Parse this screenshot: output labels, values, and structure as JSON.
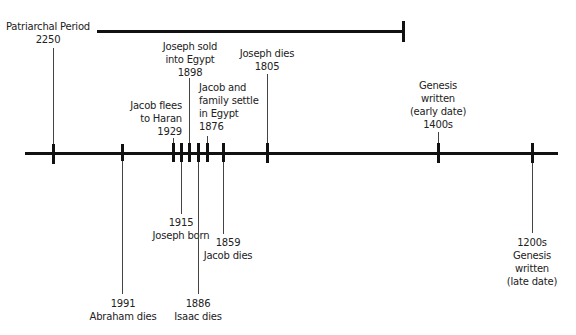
{
  "period": {
    "label": "Patriarchal Period",
    "start": "2250"
  },
  "events": [
    {
      "id": "patriarchal-start",
      "year": "2250",
      "text": "Patriarchal Period"
    },
    {
      "id": "abraham-dies",
      "year": "1991",
      "text": "Abraham dies"
    },
    {
      "id": "jacob-flees",
      "year": "1929",
      "text": "Jacob flees to Haran",
      "lines": [
        "Jacob flees",
        "to Haran"
      ]
    },
    {
      "id": "joseph-born",
      "year": "1915",
      "text": "Joseph born"
    },
    {
      "id": "joseph-sold",
      "year": "1898",
      "text": "Joseph sold into Egypt",
      "lines": [
        "Joseph sold",
        "into Egypt"
      ]
    },
    {
      "id": "isaac-dies",
      "year": "1886",
      "text": "Isaac dies"
    },
    {
      "id": "jacob-settles",
      "year": "1876",
      "text": "Jacob and family settle in Egypt",
      "lines": [
        "Jacob and",
        "family settle",
        "in Egypt"
      ]
    },
    {
      "id": "jacob-dies",
      "year": "1859",
      "text": "Jacob dies"
    },
    {
      "id": "joseph-dies",
      "year": "1805",
      "text": "Joseph dies"
    },
    {
      "id": "genesis-early",
      "year": "1400s",
      "text": "Genesis written (early date)",
      "lines": [
        "Genesis",
        "written",
        "(early date)"
      ]
    },
    {
      "id": "genesis-late",
      "year": "1200s",
      "text": "Genesis written (late date)",
      "lines": [
        "Genesis",
        "written",
        "(late date)"
      ]
    }
  ],
  "colors": {
    "line": "#111111",
    "text": "#222222",
    "background": "#ffffff"
  }
}
